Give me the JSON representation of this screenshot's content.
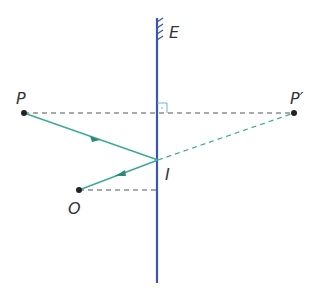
{
  "labels": {
    "mirror": "E",
    "object_point": "P",
    "image_point": "P′",
    "incidence_point": "I",
    "observer": "O"
  },
  "colors": {
    "mirror": "#3a56b0",
    "ray": "#3aaa94",
    "ray_dark": "#2d8a78",
    "construction": "#555555",
    "right_angle": "#5aa8d8",
    "point": "#222222"
  },
  "points": {
    "P": [
      24,
      113
    ],
    "P_prime": [
      294,
      113
    ],
    "I": [
      158,
      160
    ],
    "O": [
      79,
      190
    ]
  }
}
